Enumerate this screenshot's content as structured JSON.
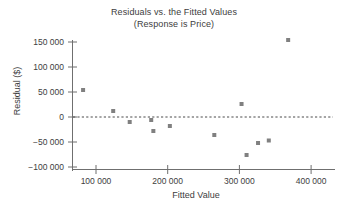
{
  "chart_data": {
    "type": "scatter",
    "title": "Residuals vs. the Fitted Values",
    "subtitle": "(Response is Price)",
    "xlabel": "Fitted Value",
    "ylabel": "Residual ($)",
    "xlim": [
      60000,
      430000
    ],
    "ylim": [
      -115000,
      165000
    ],
    "xticks": [
      100000,
      200000,
      300000,
      400000
    ],
    "yticks": [
      150000,
      100000,
      50000,
      0,
      -50000,
      -100000
    ],
    "xtick_labels": [
      "100 000",
      "200 000",
      "300 000",
      "400 000"
    ],
    "ytick_labels": [
      "150 000",
      "100 000",
      "50 000",
      "0",
      "-50 000",
      "-100 000"
    ],
    "grid": false,
    "legend": null,
    "reference_line": {
      "value": 0,
      "orientation": "horizontal",
      "style": "dashed",
      "label": "zero-residual-line"
    },
    "marker": {
      "shape": "square",
      "size": 4,
      "color": "#808080"
    },
    "points": [
      {
        "x": 82000,
        "y": 54000
      },
      {
        "x": 124000,
        "y": 12000
      },
      {
        "x": 147000,
        "y": -10000
      },
      {
        "x": 177000,
        "y": -6000
      },
      {
        "x": 180000,
        "y": -28000
      },
      {
        "x": 203000,
        "y": -18000
      },
      {
        "x": 265000,
        "y": -36000
      },
      {
        "x": 303000,
        "y": 26000
      },
      {
        "x": 310000,
        "y": -76000
      },
      {
        "x": 326000,
        "y": -52000
      },
      {
        "x": 341000,
        "y": -47000
      },
      {
        "x": 368000,
        "y": 154000
      }
    ]
  },
  "colors": {
    "axis": "#6f6f6f",
    "text": "#3d3d3d",
    "marker": "#808080",
    "reference_line": "#4a4a4a",
    "background": "#ffffff"
  }
}
